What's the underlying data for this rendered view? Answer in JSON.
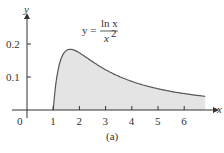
{
  "chart_data": {
    "type": "area",
    "title": "",
    "function": "y = ln x / x^2",
    "annotation": {
      "lhs": "y =",
      "numerator": "ln x",
      "denominator": "x",
      "exponent": "2"
    },
    "xlabel": "x",
    "ylabel": "y",
    "x_ticks": [
      "0",
      "1",
      "2",
      "3",
      "4",
      "5",
      "6"
    ],
    "y_ticks": [
      "0.1",
      "0.2"
    ],
    "xlim": [
      0,
      7
    ],
    "ylim": [
      0,
      0.22
    ],
    "shaded_region": {
      "from": 1,
      "to": 6.8,
      "color": "#e4e4e4"
    },
    "x": [
      1,
      1.25,
      1.5,
      1.65,
      2,
      2.5,
      3,
      3.5,
      4,
      4.5,
      5,
      5.5,
      6,
      6.5,
      6.8
    ],
    "values": [
      0,
      0.143,
      0.18,
      0.184,
      0.173,
      0.147,
      0.122,
      0.102,
      0.087,
      0.074,
      0.064,
      0.056,
      0.05,
      0.044,
      0.041
    ],
    "grid": false,
    "caption": "(a)"
  }
}
